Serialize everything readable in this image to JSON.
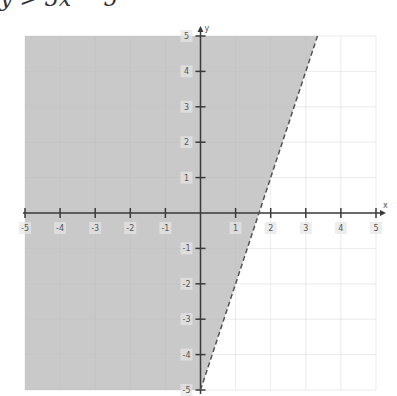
{
  "header": {
    "cropped_text": "y > 3x − 5"
  },
  "chart_data": {
    "type": "inequality-graph",
    "title": "",
    "inequality": "y > 3x - 5",
    "boundary_line": {
      "slope": 3,
      "intercept": -5,
      "style": "dashed",
      "points": [
        [
          0,
          -5
        ],
        [
          3.333,
          5
        ]
      ]
    },
    "shaded_region": "left/above boundary line",
    "xlabel": "x",
    "ylabel": "y",
    "xlim": [
      -5,
      5
    ],
    "ylim": [
      -5,
      5
    ],
    "x_ticks": [
      -5,
      -4,
      -3,
      -2,
      -1,
      1,
      2,
      3,
      4,
      5
    ],
    "y_ticks": [
      -5,
      -4,
      -3,
      -2,
      -1,
      1,
      2,
      3,
      4,
      5
    ],
    "grid": true,
    "colors": {
      "shade": "#c9c9c9",
      "axis": "#3a3a3a",
      "grid": "#bdbdbd",
      "boundary": "#555555"
    }
  }
}
